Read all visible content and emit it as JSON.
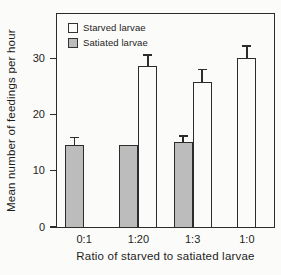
{
  "figure": {
    "background": "#fbfbf9",
    "axis_color": "#2c2c2c",
    "text_color": "#1d1d1d"
  },
  "chart_data": {
    "type": "bar",
    "title": "",
    "xlabel": "Ratio of starved to satiated larvae",
    "ylabel": "Mean number of feedings per hour",
    "categories": [
      "0:1",
      "1:20",
      "1:3",
      "1:0"
    ],
    "series": [
      {
        "name": "Starved larvae",
        "fill": "#fbfbf9",
        "slot": "right",
        "values": [
          null,
          28.6,
          25.8,
          30.0
        ],
        "errors": [
          null,
          2.1,
          2.3,
          2.3
        ]
      },
      {
        "name": "Satiated larvae",
        "fill": "#bcbcbc",
        "slot": "left",
        "values": [
          14.6,
          14.6,
          15.1,
          null
        ],
        "errors": [
          1.5,
          0,
          1.2,
          null
        ]
      }
    ],
    "ylim": [
      0,
      37.9
    ],
    "yticks": [
      0,
      10,
      20,
      30
    ],
    "legend_position": "top-left",
    "grid": false
  }
}
